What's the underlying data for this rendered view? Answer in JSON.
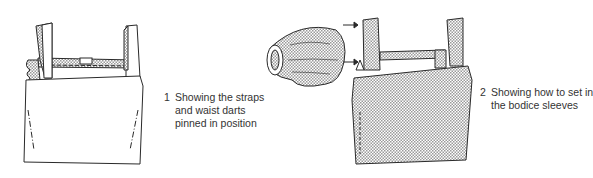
{
  "figures": [
    {
      "number": "1",
      "caption_lines": [
        "Showing the straps",
        "and waist darts",
        "pinned in position"
      ],
      "subject": "bodice with straps and waist darts pinned",
      "shading": "unshaded bodice, shaded straps"
    },
    {
      "number": "2",
      "caption_lines": [
        "Showing how to set in",
        "the bodice sleeves"
      ],
      "subject": "bodice with gathered sleeve and arrows indicating insertion",
      "shading": "stippled bodice and sleeve"
    }
  ],
  "colors": {
    "line": "#2a2a2a",
    "stipple": "#bdbdbd",
    "background": "#ffffff"
  }
}
